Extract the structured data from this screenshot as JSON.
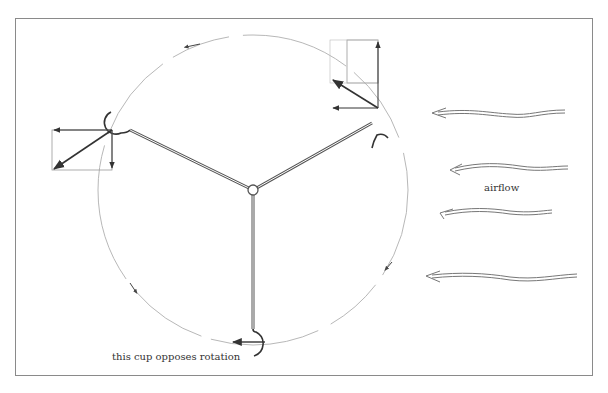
{
  "diagram": {
    "labels": {
      "airflow": "airflow",
      "opposing_cup": "this cup opposes rotation"
    },
    "colors": {
      "frame": "#8a8a8a",
      "arm": "#555555",
      "vector": "#333333",
      "rotation_path": "#b0b0b0",
      "airflow": "#777777"
    },
    "hub": {
      "x": 253,
      "y": 190
    },
    "rotation_circle": {
      "cx": 253,
      "cy": 190,
      "r": 155,
      "direction": "counterclockwise"
    },
    "cups": [
      {
        "name": "left-cup",
        "x": 112,
        "y": 130
      },
      {
        "name": "top-right-cup",
        "x": 378,
        "y": 140
      },
      {
        "name": "bottom-cup",
        "x": 256,
        "y": 345
      }
    ],
    "airflow_arrows": 4
  }
}
